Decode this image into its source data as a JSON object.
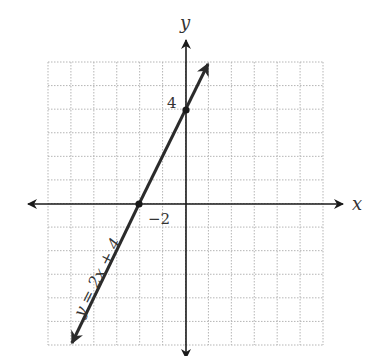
{
  "chart_data": {
    "type": "line",
    "title": "",
    "xlabel": "x",
    "ylabel": "y",
    "xlim": [
      -6,
      6
    ],
    "ylim": [
      -6,
      6
    ],
    "grid": true,
    "grid_style": "dotted",
    "series": [
      {
        "name": "y = 2x + 4",
        "equation": "y = 2x + 4",
        "slope": 2,
        "intercept": 4,
        "x": [
          -4.9,
          -2,
          0,
          1
        ],
        "y": [
          -5.8,
          0,
          4,
          6
        ],
        "arrows": "both"
      }
    ],
    "marked_points": [
      {
        "x": -2,
        "y": 0,
        "label": "−2"
      },
      {
        "x": 0,
        "y": 4,
        "label": "4"
      }
    ],
    "annotations": [
      "y = 2x + 4"
    ]
  },
  "labels": {
    "x_axis": "x",
    "y_axis": "y",
    "x_intercept": "−2",
    "y_intercept": "4",
    "equation": "y = 2x + 4"
  },
  "colors": {
    "line": "#2b2b2b",
    "axis": "#1a1a1a",
    "grid": "#b5b5b5"
  }
}
